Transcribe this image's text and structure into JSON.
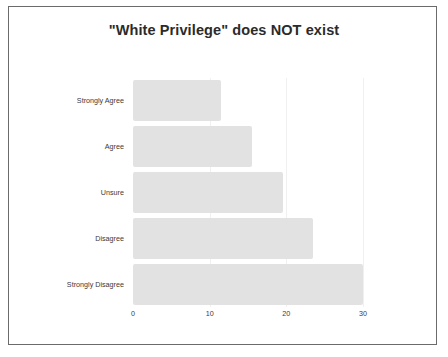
{
  "chart_data": {
    "type": "bar",
    "orientation": "horizontal",
    "title": "\"White Privilege\" does NOT exist",
    "xlabel": "",
    "ylabel": "",
    "categories": [
      "Strongly Agree",
      "Agree",
      "Unsure",
      "Disagree",
      "Strongly Disagree"
    ],
    "values": [
      11.5,
      15.5,
      19.5,
      23.5,
      30
    ],
    "xlim": [
      0,
      30
    ],
    "xticks": [
      0,
      10,
      20,
      30
    ],
    "xtick_labels": [
      "0",
      "10",
      "20",
      "30"
    ],
    "grid": true,
    "grid_axis": "x",
    "legend": false,
    "bar_color": "#e2e2e2",
    "title_color": "#2b2b2b",
    "tick_label_color": "#3a3a3a",
    "frame_color": "#6b6b6b",
    "background_color": "#ffffff"
  }
}
